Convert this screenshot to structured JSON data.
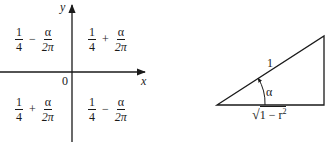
{
  "quadrant_diagram": {
    "axis_x_label": "x",
    "axis_y_label": "y",
    "origin_label": "0",
    "quadrants": {
      "top_left": {
        "a_num": "1",
        "a_den": "4",
        "op": "−",
        "b_num": "α",
        "b_den": "2π"
      },
      "top_right": {
        "a_num": "1",
        "a_den": "4",
        "op": "+",
        "b_num": "α",
        "b_den": "2π"
      },
      "bottom_left": {
        "a_num": "1",
        "a_den": "4",
        "op": "+",
        "b_num": "α",
        "b_den": "2π"
      },
      "bottom_right": {
        "a_num": "1",
        "a_den": "4",
        "op": "−",
        "b_num": "α",
        "b_den": "2π"
      }
    }
  },
  "triangle_diagram": {
    "hypotenuse_label": "1",
    "angle_label": "α",
    "base_label_radicand": "1 − r",
    "base_label_exponent": "2",
    "base_label_sqrt": "√"
  },
  "colors": {
    "ink": "#1a1a1a",
    "background": "#ffffff"
  }
}
